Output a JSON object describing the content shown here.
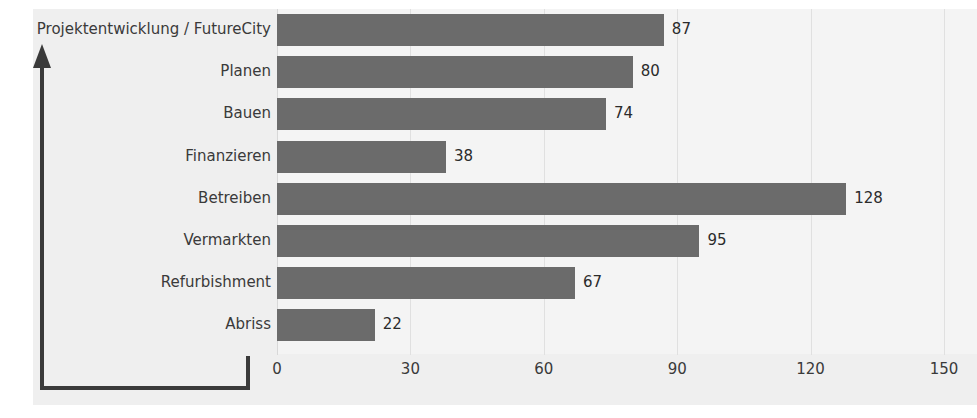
{
  "chart_data": {
    "type": "bar",
    "orientation": "horizontal",
    "title": "",
    "subtitle": "",
    "xlabel": "",
    "ylabel": "",
    "categories": [
      "Projektentwicklung / FutureCity",
      "Planen",
      "Bauen",
      "Finanzieren",
      "Betreiben",
      "Vermarkten",
      "Refurbishment",
      "Abriss"
    ],
    "values": [
      87,
      80,
      74,
      38,
      128,
      95,
      67,
      22
    ],
    "data_labels": [
      "87",
      "80",
      "74",
      "38",
      "128",
      "95",
      "67",
      "22"
    ],
    "xlim": [
      0,
      150
    ],
    "xticks": [
      0,
      30,
      60,
      90,
      120,
      150
    ],
    "xtick_labels": [
      "0",
      "30",
      "60",
      "90",
      "120",
      "150"
    ],
    "grid": "vertical",
    "legend": "none",
    "bar_color": "#6b6b6b",
    "plot_background": "#f4f4f4",
    "figure_background": "#efefef",
    "axis_color": "#3a3a3a",
    "gridline_color": "#e0e0e0",
    "label_color": "#3a3a3a"
  },
  "axis_decoration": {
    "arrow_name": "y-axis-arrow",
    "bracket_name": "axis-bracket"
  }
}
